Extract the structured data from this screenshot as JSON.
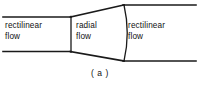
{
  "figure": {
    "caption": "( a )",
    "line_color": "#1a1a1a",
    "background_color": "#ffffff",
    "zones": [
      {
        "name": "left-rectilinear",
        "label": "rectilinear\nflow"
      },
      {
        "name": "radial",
        "label": "radial\nflow"
      },
      {
        "name": "right-rectilinear",
        "label": "rectilinear\nflow"
      }
    ],
    "geometry": {
      "left_duct_top_y": 17,
      "left_duct_bottom_y": 51,
      "left_duct_start_x": 3,
      "divider_x": 71,
      "radial_exit_top": {
        "x": 124,
        "y": 5
      },
      "radial_exit_bottom": {
        "x": 124,
        "y": 61
      },
      "arc_bulge_x": 130,
      "right_duct_end_x": 196
    }
  }
}
